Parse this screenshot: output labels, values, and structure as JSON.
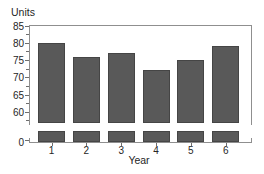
{
  "chart_data": {
    "type": "bar",
    "title": "",
    "categories": [
      "1",
      "2",
      "3",
      "4",
      "5",
      "6"
    ],
    "values": [
      80,
      76,
      77,
      72,
      75,
      79
    ],
    "xlabel": "Year",
    "ylabel": "Units",
    "y_axis": {
      "major_ticks": [
        85,
        80,
        75,
        70,
        65,
        60,
        0
      ],
      "minor_ticks": [
        82.5,
        77.5,
        72.5,
        67.5,
        62.5,
        57.5
      ],
      "visible_range": [
        60,
        85
      ],
      "axis_break": true,
      "break_note": "axis broken between 0 and ~57.5; bars drawn with white gap"
    },
    "grid": false,
    "legend": false,
    "colors": {
      "bar_fill": "#595959",
      "bar_edge": "#454545",
      "axis": "#8f8f8f",
      "text": "#262626",
      "background": "#ffffff"
    }
  }
}
